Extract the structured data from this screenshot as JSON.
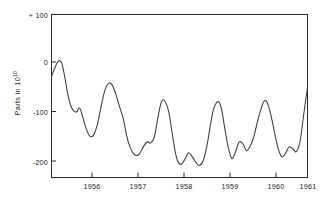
{
  "figure": {
    "background": "#ffffff",
    "line_color": "#3a3a3a",
    "axis_color": "#2b2b2b"
  },
  "axes": {
    "ylabel_prefix": "Parts in 10",
    "ylabel_exponent": "10",
    "ylabel_full": "Parts in 10^10",
    "xlabel": "",
    "y_ticks": [
      "+ 100",
      "0",
      "-100",
      "-200"
    ],
    "y_tick_values": [
      100,
      0,
      -100,
      -200
    ],
    "x_ticks": [
      "1956",
      "1957",
      "1958",
      "1959",
      "1960",
      "1961"
    ],
    "x_tick_values": [
      1956,
      1957,
      1958,
      1959,
      1960,
      1961
    ],
    "grid": false,
    "frame": "box"
  },
  "chart_data": {
    "type": "line",
    "title": "",
    "xlabel": "",
    "ylabel": "Parts in 10^10",
    "xlim": [
      1955.45,
      1961.0
    ],
    "ylim": [
      -235,
      100
    ],
    "grid": false,
    "legend": null,
    "series": [
      {
        "name": "parts-in-10e10",
        "color": "#3a3a3a",
        "x": [
          1955.45,
          1955.52,
          1955.58,
          1955.63,
          1955.68,
          1955.74,
          1955.8,
          1955.86,
          1955.93,
          1956.0,
          1956.04,
          1956.08,
          1956.13,
          1956.2,
          1956.28,
          1956.36,
          1956.44,
          1956.52,
          1956.6,
          1956.68,
          1956.76,
          1956.84,
          1956.92,
          1957.0,
          1957.06,
          1957.12,
          1957.2,
          1957.28,
          1957.36,
          1957.44,
          1957.52,
          1957.6,
          1957.68,
          1957.76,
          1957.84,
          1957.92,
          1958.0,
          1958.06,
          1958.12,
          1958.18,
          1958.26,
          1958.34,
          1958.42,
          1958.5,
          1958.58,
          1958.66,
          1958.74,
          1958.82,
          1958.9,
          1958.96,
          1959.02,
          1959.08,
          1959.14,
          1959.2,
          1959.28,
          1959.36,
          1959.44,
          1959.52,
          1959.6,
          1959.68,
          1959.76,
          1959.84,
          1959.92,
          1960.0,
          1960.06,
          1960.12,
          1960.2,
          1960.28,
          1960.36,
          1960.44,
          1960.52,
          1960.6,
          1960.68,
          1960.76,
          1960.84,
          1960.92,
          1961.0
        ],
        "y": [
          -28,
          -10,
          2,
          5,
          -2,
          -30,
          -62,
          -86,
          -98,
          -100,
          -92,
          -96,
          -112,
          -134,
          -150,
          -148,
          -128,
          -92,
          -58,
          -42,
          -44,
          -62,
          -88,
          -112,
          -140,
          -164,
          -182,
          -190,
          -186,
          -172,
          -162,
          -164,
          -152,
          -110,
          -78,
          -80,
          -104,
          -140,
          -176,
          -200,
          -208,
          -198,
          -184,
          -192,
          -204,
          -210,
          -200,
          -170,
          -124,
          -96,
          -82,
          -80,
          -96,
          -130,
          -172,
          -196,
          -182,
          -162,
          -166,
          -180,
          -170,
          -150,
          -118,
          -92,
          -78,
          -80,
          -104,
          -140,
          -174,
          -192,
          -186,
          -172,
          -176,
          -182,
          -160,
          -104,
          -50
        ]
      }
    ],
    "annotations": []
  }
}
